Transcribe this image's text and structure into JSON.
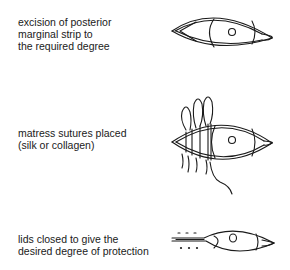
{
  "steps": [
    {
      "caption": "excision of posterior\nmarginal strip to\nthe required degree",
      "figure": "eye-with-excised-lid-margin"
    },
    {
      "caption": "matress sutures placed\n(silk or collagen)",
      "figure": "eye-with-mattress-sutures"
    },
    {
      "caption": "lids closed to give the\ndesired degree of protection",
      "figure": "eye-with-lids-partially-closed"
    }
  ]
}
